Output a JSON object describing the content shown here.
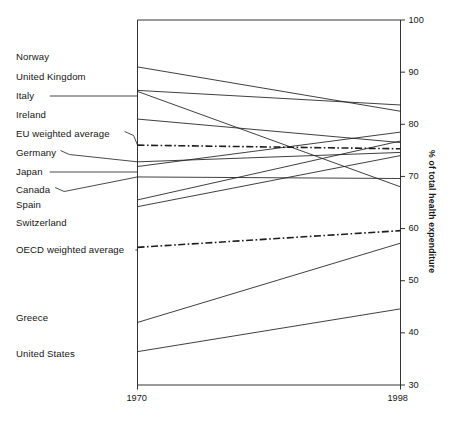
{
  "chart_data": {
    "type": "line",
    "title": "",
    "subtitle": "",
    "xlabel": "",
    "ylabel": "% of total health expenditure",
    "x": [
      1970,
      1998
    ],
    "xtick_labels": [
      "1970",
      "1998"
    ],
    "xlim": [
      1970,
      1998
    ],
    "ylim": [
      30,
      100
    ],
    "ytick_labels": [
      "100",
      "90",
      "80",
      "70",
      "60",
      "50",
      "40",
      "30"
    ],
    "yticks": [
      100,
      90,
      80,
      70,
      60,
      50,
      40,
      30
    ],
    "grid": false,
    "legend_position": "left-labels",
    "annotations": [
      "Leader lines connect the left-hand country labels to the start of each line at 1970.",
      "EU weighted average and OECD weighted average are drawn as dash-dot lines."
    ],
    "series": [
      {
        "name": "Norway",
        "values": [
          91.0,
          82.5
        ],
        "style": "solid",
        "label_y": 57,
        "leader": "none"
      },
      {
        "name": "United Kingdom",
        "values": [
          86.5,
          83.7
        ],
        "style": "solid",
        "label_y": 77,
        "leader": "none"
      },
      {
        "name": "Italy",
        "values": [
          86.3,
          68.0
        ],
        "style": "solid",
        "label_y": 96,
        "leader": "horizontal"
      },
      {
        "name": "Ireland",
        "values": [
          81.0,
          76.5
        ],
        "style": "solid",
        "label_y": 115,
        "leader": "none"
      },
      {
        "name": "EU weighted average",
        "values": [
          76.0,
          75.3
        ],
        "style": "dashdot",
        "label_y": 134,
        "leader": "diagonal"
      },
      {
        "name": "Germany",
        "values": [
          72.8,
          74.6
        ],
        "style": "solid",
        "label_y": 153,
        "leader": "diagonal"
      },
      {
        "name": "Japan",
        "values": [
          71.9,
          78.5
        ],
        "style": "solid",
        "label_y": 172,
        "leader": "horizontal"
      },
      {
        "name": "Canada",
        "values": [
          69.9,
          69.6
        ],
        "style": "solid",
        "label_y": 190,
        "leader": "diagonal"
      },
      {
        "name": "Spain",
        "values": [
          65.5,
          76.8
        ],
        "style": "solid",
        "label_y": 205,
        "leader": "none"
      },
      {
        "name": "Switzerland",
        "values": [
          64.2,
          74.0
        ],
        "style": "solid",
        "label_y": 223,
        "leader": "none"
      },
      {
        "name": "OECD weighted average",
        "values": [
          56.4,
          59.6
        ],
        "style": "dashdot",
        "label_y": 250,
        "leader": "horizontal"
      },
      {
        "name": "Greece",
        "values": [
          42.0,
          57.2
        ],
        "style": "solid",
        "label_y": 318,
        "leader": "none"
      },
      {
        "name": "United States",
        "values": [
          36.4,
          44.6
        ],
        "style": "solid",
        "label_y": 354,
        "leader": "none"
      }
    ]
  },
  "axis": {
    "y_axis_title": "% of total health expenditure",
    "x_start_label": "1970",
    "x_end_label": "1998"
  }
}
